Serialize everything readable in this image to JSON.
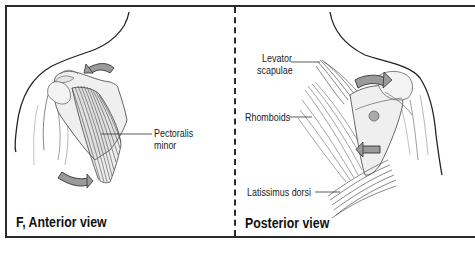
{
  "figure": {
    "panels": [
      {
        "caption": "F, Anterior view",
        "labels": [
          {
            "text_line1": "Pectoralis",
            "text_line2": "minor"
          }
        ]
      },
      {
        "caption": "Posterior view",
        "labels": [
          {
            "text_line1": "Levator",
            "text_line2": "scapulae"
          },
          {
            "text_line1": "Rhomboids"
          },
          {
            "text_line1": "Latissimus dorsi"
          }
        ]
      }
    ],
    "colors": {
      "frame": "#2a2a2a",
      "arrow_fill": "#9a9a9a",
      "muscle_stroke": "#555555",
      "bone_fill": "#eeeeee"
    }
  }
}
